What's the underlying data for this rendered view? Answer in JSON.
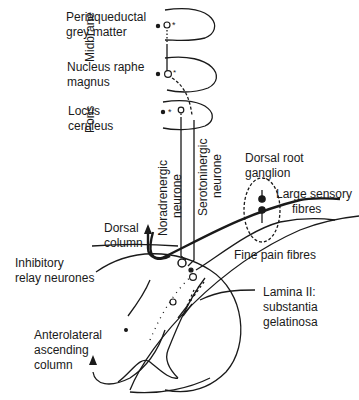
{
  "diagram": {
    "regions": {
      "midbrane": "Midbrane",
      "pons": "Pons"
    },
    "nuclei": {
      "periaqueductal": [
        "Periaqueductal",
        "grey matter"
      ],
      "raphe": [
        "Nucleus raphe",
        "magnus"
      ],
      "locus": [
        "Locus",
        "ceruleus"
      ]
    },
    "neurones": {
      "noradrenergic": [
        "Noradrenergic",
        "neurone"
      ],
      "serotoninergic": [
        "Serotoninergic",
        "neurone"
      ]
    },
    "labels": {
      "dorsal_root_ganglion": [
        "Dorsal root",
        "ganglion"
      ],
      "large_sensory_fibres": [
        "Large sensory",
        "fibres"
      ],
      "dorsal_column": [
        "Dorsal",
        "column"
      ],
      "fine_pain_fibres": "Fine pain fibres",
      "inhibitory_relay": [
        "Inhibitory",
        "relay neurones"
      ],
      "lamina_ii": [
        "Lamina II:",
        "substantia",
        "gelatinosa"
      ],
      "anterolateral": [
        "Anterolateral",
        "ascending",
        "column"
      ]
    },
    "colors": {
      "ink": "#1a1a1a",
      "background": "#ffffff"
    }
  }
}
